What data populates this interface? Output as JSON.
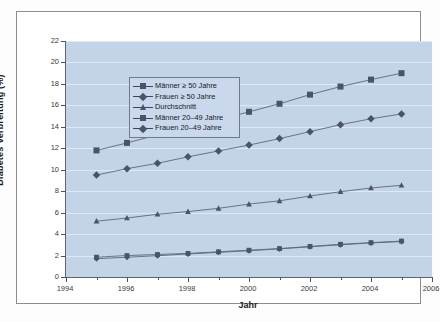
{
  "chart_data": {
    "type": "line",
    "title": "",
    "xlabel": "Jahr",
    "ylabel": "Diabetes Verbreitung (%)",
    "xlim": [
      1994,
      2006
    ],
    "ylim": [
      0,
      22
    ],
    "ytick_step": 2,
    "xtick_step": 2,
    "grid": true,
    "legend_position": "upper-left inside plot",
    "x": [
      1995,
      1996,
      1997,
      1998,
      1999,
      2000,
      2001,
      2002,
      2003,
      2004,
      2005
    ],
    "xticks": [
      "1994",
      "1996",
      "1998",
      "2000",
      "2002",
      "2004",
      "2006"
    ],
    "xminorticks": [
      "1995",
      "1997",
      "1999",
      "2001",
      "2003",
      "2005"
    ],
    "yticks": [
      "0",
      "2",
      "4",
      "6",
      "8",
      "10",
      "12",
      "14",
      "16",
      "18",
      "20",
      "22"
    ],
    "series": [
      {
        "name": "Männer ≥ 50 Jahre",
        "marker": "square",
        "values": [
          11.8,
          12.5,
          13.25,
          13.95,
          14.65,
          15.4,
          16.15,
          17.0,
          17.75,
          18.4,
          19.0
        ]
      },
      {
        "name": "Frauen ≥ 50 Jahre",
        "marker": "diamond",
        "values": [
          9.5,
          10.1,
          10.6,
          11.2,
          11.75,
          12.3,
          12.9,
          13.55,
          14.2,
          14.75,
          15.2
        ]
      },
      {
        "name": "Durchschnitt",
        "marker": "triangle",
        "values": [
          5.2,
          5.5,
          5.85,
          6.1,
          6.4,
          6.8,
          7.1,
          7.55,
          7.95,
          8.3,
          8.55
        ]
      },
      {
        "name": "Männer 20–49 Jahre",
        "marker": "square",
        "values": [
          1.85,
          2.0,
          2.1,
          2.2,
          2.35,
          2.5,
          2.65,
          2.85,
          3.05,
          3.2,
          3.35
        ]
      },
      {
        "name": "Frauen 20–49 Jahre",
        "marker": "diamond",
        "values": [
          1.7,
          1.85,
          1.98,
          2.15,
          2.3,
          2.45,
          2.62,
          2.82,
          3.0,
          3.18,
          3.3
        ]
      }
    ],
    "colors": {
      "plot_background": "#c3d4e9",
      "gridline": "#dfe8f3",
      "series_marker": "#49536a",
      "series_line": "#5d6878",
      "axis": "#4a5260",
      "text": "#1d1d1d",
      "legend_background": "#c9d8ec",
      "frame_border": "#8d8d8d"
    }
  }
}
